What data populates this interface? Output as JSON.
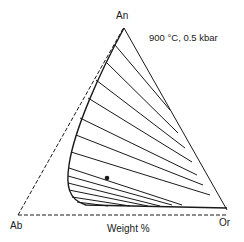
{
  "diagram": {
    "type": "ternary-phase-diagram",
    "title": "900 °C, 0.5 kbar",
    "vertices": {
      "top": "An",
      "left": "Ab",
      "right": "Or"
    },
    "axis_label": "Weight %",
    "features": {
      "solvus_curve": "two-feldspar solvus",
      "tie_line_count": 13,
      "marked_point": "bulk composition dot"
    },
    "colors": {
      "line": "#1a1a1a",
      "background": "#ffffff"
    }
  }
}
